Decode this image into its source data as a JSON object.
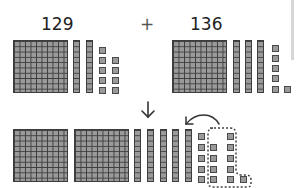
{
  "equation": {
    "addend1": "129",
    "operator": "+",
    "addend2": "136"
  },
  "colors": {
    "block_fill": "#9a9a9a",
    "block_line": "#3d3d3d",
    "text": "#222222"
  },
  "blocks": {
    "addend1": {
      "hundreds": 1,
      "tens": 2,
      "ones": 9
    },
    "addend2": {
      "hundreds": 1,
      "tens": 3,
      "ones": 6
    },
    "result": {
      "hundreds": 2,
      "tens": 5,
      "ones": 15,
      "regroup_ones": 10
    }
  },
  "icons": {
    "down_arrow": "down-arrow-icon",
    "regroup_arrow": "curved-arrow-icon"
  }
}
